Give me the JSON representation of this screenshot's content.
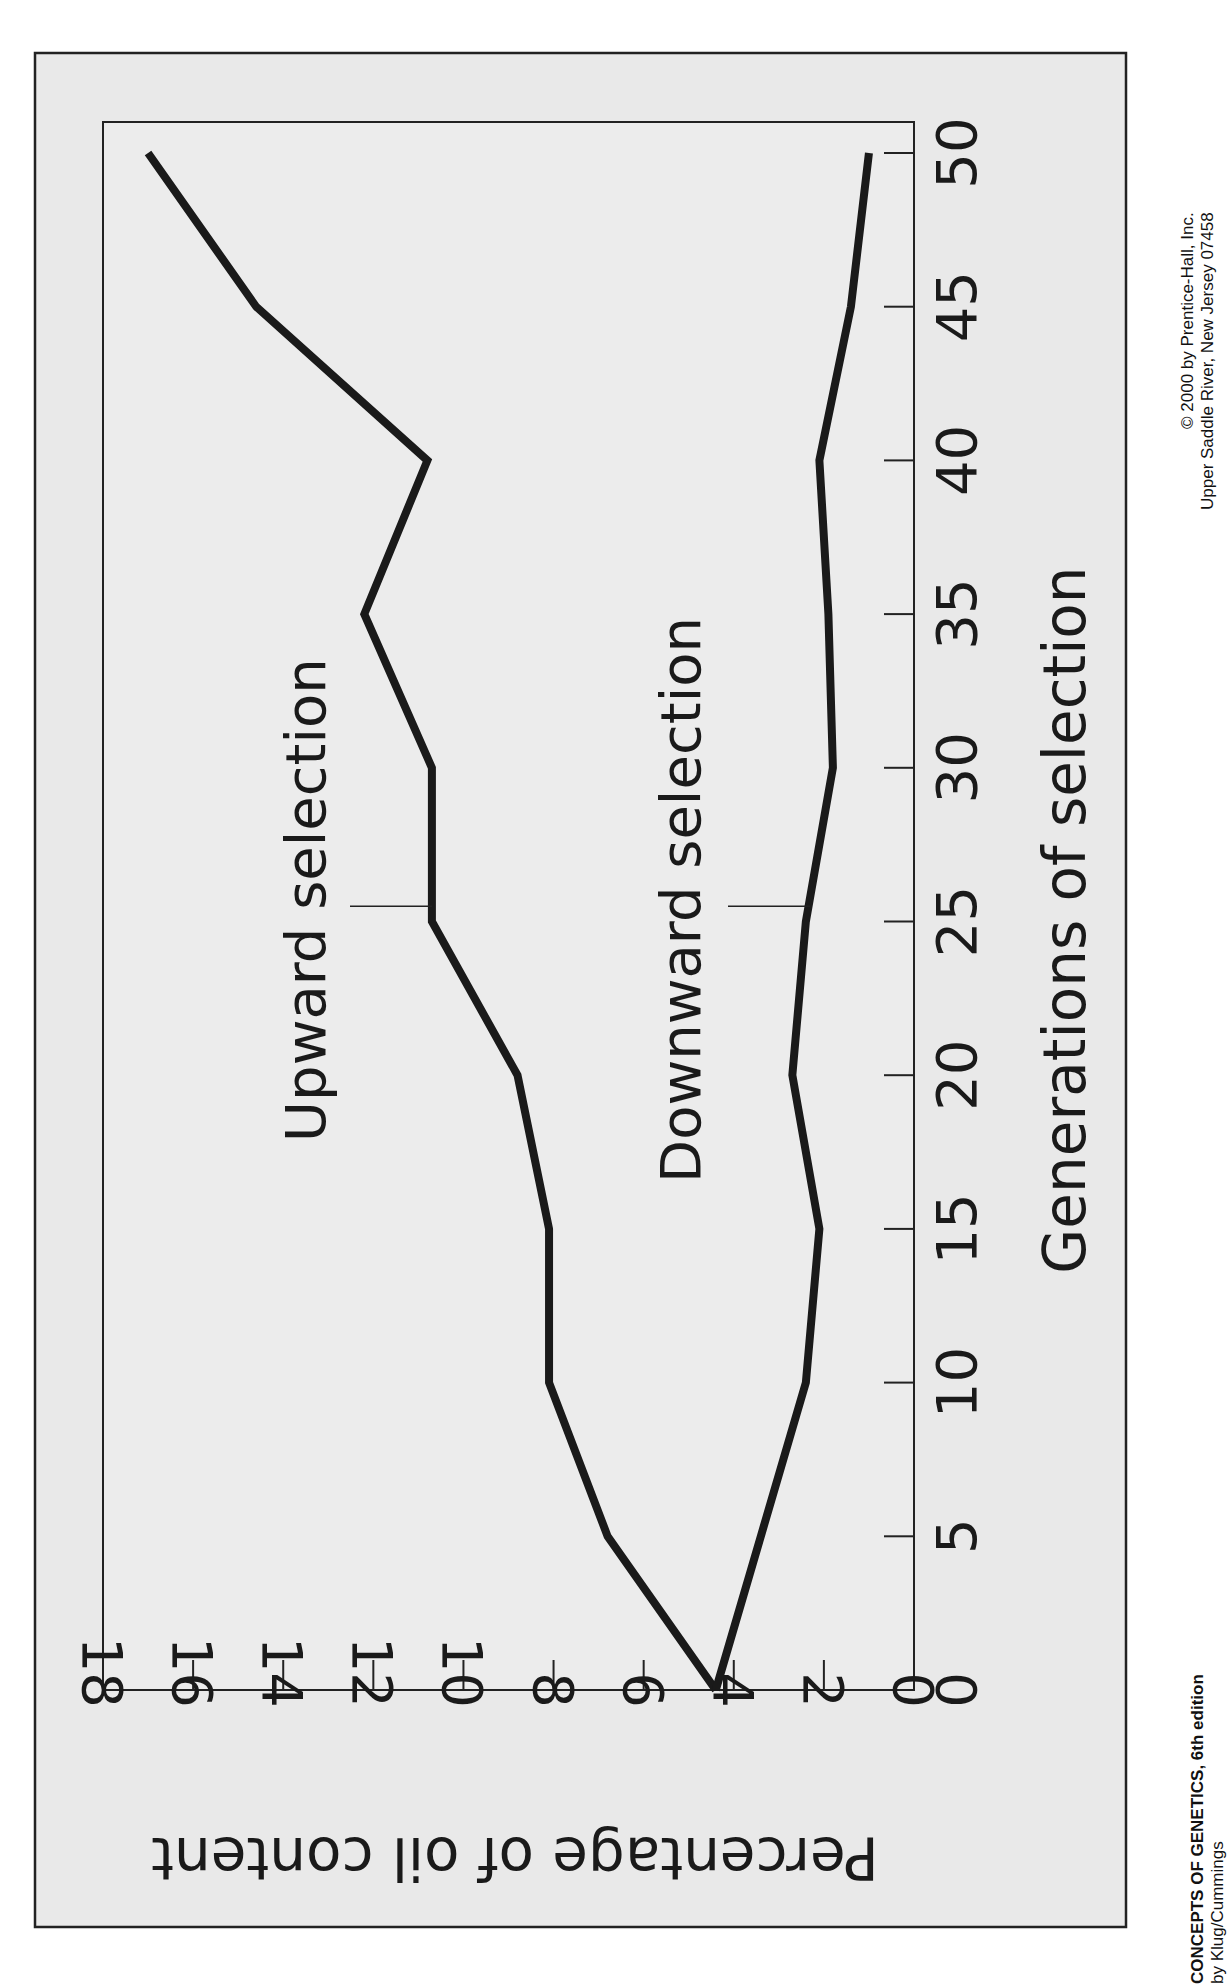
{
  "chart_data": {
    "type": "line",
    "orientation": "rotated 90 degrees (page printed sideways)",
    "title": "",
    "xlabel": "Generations of selection",
    "ylabel": "Percentage of oil content",
    "x": [
      0,
      5,
      10,
      15,
      20,
      25,
      30,
      35,
      40,
      45,
      50
    ],
    "xlim": [
      0,
      50
    ],
    "ylim": [
      0,
      18
    ],
    "x_ticks": [
      0,
      5,
      10,
      15,
      20,
      25,
      30,
      35,
      40,
      45,
      50
    ],
    "y_ticks": [
      0,
      2,
      4,
      6,
      8,
      10,
      12,
      14,
      16,
      18
    ],
    "grid": false,
    "legend": "inline labels with callout lines",
    "series": [
      {
        "name": "Upward selection",
        "values": [
          4.4,
          6.8,
          8.1,
          8.1,
          8.8,
          10.7,
          10.7,
          12.2,
          10.8,
          14.6,
          17.0
        ]
      },
      {
        "name": "Downward selection",
        "values": [
          4.4,
          3.4,
          2.4,
          2.1,
          2.7,
          2.4,
          1.8,
          1.9,
          2.1,
          1.4,
          1.0
        ]
      }
    ],
    "annotations": [
      {
        "text": "Upward selection",
        "callout_at_x": 25.5
      },
      {
        "text": "Downward selection",
        "callout_at_x": 25.5
      }
    ]
  },
  "credits": {
    "book_title": "CONCEPTS OF GENETICS, 6th edition",
    "authors": "by Klug/Cummings",
    "copyright": "© 2000 by Prentice-Hall, Inc.",
    "address": "Upper Saddle River, New Jersey 07458"
  }
}
